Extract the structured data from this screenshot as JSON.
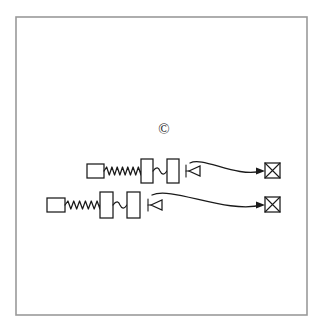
{
  "canvas": {
    "width": 324,
    "height": 334,
    "background_color": "#ffffff"
  },
  "frame": {
    "name": "outer-border",
    "x": 16,
    "y": 17,
    "width": 291,
    "height": 298,
    "stroke_color": "#9a9a9a",
    "fill_color": "#ffffff"
  },
  "annotations": [
    {
      "name": "copyright-symbol",
      "text": "©",
      "x": 164,
      "y": 134,
      "color": "#1a1a1a"
    }
  ],
  "diagram": {
    "stroke_color": "#1a1a1a",
    "fill_color": "#ffffff",
    "chains": [
      {
        "id": "chain-top",
        "baseline_y": 171,
        "components": [
          {
            "name": "source-square",
            "type": "square",
            "x": 87,
            "y": 164,
            "width": 17,
            "height": 14
          },
          {
            "name": "zigzag-spring",
            "type": "zigzag",
            "x1": 104,
            "x2": 141,
            "y": 171,
            "amplitude": 4,
            "peaks": 7
          },
          {
            "name": "tall-rectangle-1",
            "type": "rect",
            "x": 141,
            "y": 159,
            "width": 12,
            "height": 24
          },
          {
            "name": "wave-link",
            "type": "wave",
            "x1": 153,
            "x2": 167,
            "y": 171,
            "amplitude": 3
          },
          {
            "name": "tall-rectangle-2",
            "type": "rect",
            "x": 167,
            "y": 159,
            "width": 12,
            "height": 24
          },
          {
            "name": "diode-bar",
            "type": "vbar",
            "x": 186,
            "y": 165,
            "height": 12
          },
          {
            "name": "diode-triangle",
            "type": "triangle-left",
            "x": 189,
            "y": 171,
            "size": 11
          }
        ],
        "connector": {
          "name": "curved-arrow-top",
          "type": "curve-arrow",
          "start_x": 190,
          "start_y": 163,
          "c1x": 203,
          "c1y": 156,
          "c2x": 236,
          "c2y": 178,
          "end_x": 262,
          "end_y": 171
        },
        "terminal": {
          "name": "crossed-square-terminal",
          "type": "crossed-square",
          "x": 265,
          "y": 163,
          "size": 15
        }
      },
      {
        "id": "chain-bottom",
        "baseline_y": 205,
        "components": [
          {
            "name": "source-square",
            "type": "square",
            "x": 47,
            "y": 198,
            "width": 18,
            "height": 14
          },
          {
            "name": "zigzag-spring",
            "type": "zigzag",
            "x1": 65,
            "x2": 100,
            "y": 205,
            "amplitude": 4,
            "peaks": 6
          },
          {
            "name": "tall-rectangle-1",
            "type": "rect",
            "x": 100,
            "y": 192,
            "width": 13,
            "height": 26
          },
          {
            "name": "wave-link",
            "type": "wave",
            "x1": 113,
            "x2": 127,
            "y": 205,
            "amplitude": 3
          },
          {
            "name": "tall-rectangle-2",
            "type": "rect",
            "x": 127,
            "y": 192,
            "width": 13,
            "height": 26
          },
          {
            "name": "diode-bar",
            "type": "vbar",
            "x": 148,
            "y": 199,
            "height": 12
          },
          {
            "name": "diode-triangle",
            "type": "triangle-left",
            "x": 151,
            "y": 205,
            "size": 11
          }
        ],
        "connector": {
          "name": "curved-arrow-bottom",
          "type": "curve-arrow",
          "start_x": 152,
          "start_y": 195,
          "c1x": 172,
          "c1y": 186,
          "c2x": 226,
          "c2y": 214,
          "end_x": 262,
          "end_y": 205
        },
        "terminal": {
          "name": "crossed-square-terminal",
          "type": "crossed-square",
          "x": 265,
          "y": 197,
          "size": 15
        }
      }
    ]
  }
}
